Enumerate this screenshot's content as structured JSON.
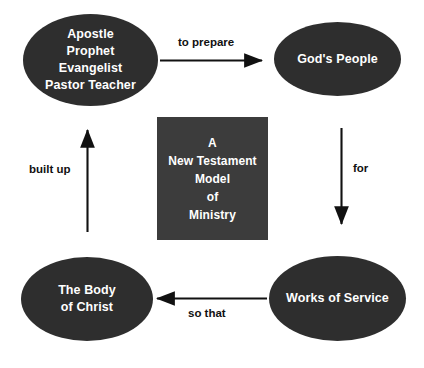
{
  "diagram": {
    "title": "A New Testament Model of Ministry",
    "background_color": "#ffffff",
    "node_fill_color": "#2e2e2e",
    "center_box_fill_color": "#3c3c3c",
    "node_text_color": "#ffffff",
    "arrow_color": "#111111",
    "label_text_color": "#111111",
    "nodes": [
      {
        "id": "roles",
        "shape": "ellipse",
        "label": "Apostle\nProphet\nEvangelist\nPastor Teacher",
        "position": "top-left"
      },
      {
        "id": "gods-people",
        "shape": "ellipse",
        "label": "God's People",
        "position": "top-right"
      },
      {
        "id": "works-of-service",
        "shape": "ellipse",
        "label": "Works of Service",
        "position": "bottom-right"
      },
      {
        "id": "body-of-christ",
        "shape": "ellipse",
        "label": "The Body\nof Christ",
        "position": "bottom-left"
      },
      {
        "id": "center-title",
        "shape": "rectangle",
        "label": "A\nNew Testament\nModel\nof\nMinistry",
        "position": "center"
      }
    ],
    "arrows": [
      {
        "id": "to-prepare",
        "label": "to prepare",
        "from": "roles",
        "to": "gods-people",
        "direction": "right"
      },
      {
        "id": "for",
        "label": "for",
        "from": "gods-people",
        "to": "works-of-service",
        "direction": "down"
      },
      {
        "id": "so-that",
        "label": "so that",
        "from": "works-of-service",
        "to": "body-of-christ",
        "direction": "left"
      },
      {
        "id": "built-up",
        "label": "built up",
        "from": "body-of-christ",
        "to": "roles",
        "direction": "up"
      }
    ]
  }
}
